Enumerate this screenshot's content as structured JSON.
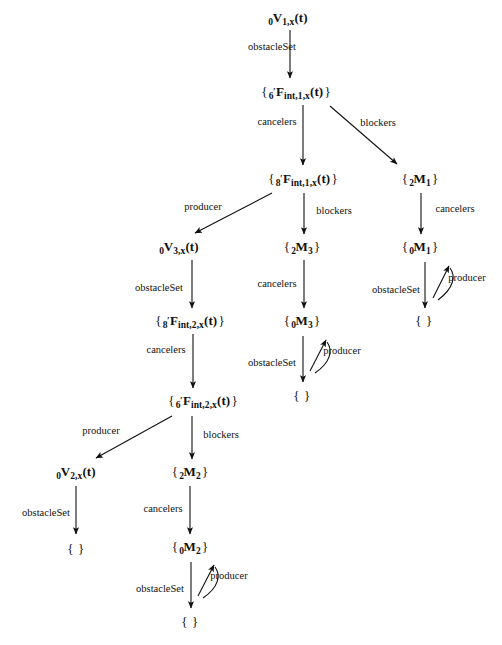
{
  "diagram": {
    "title": "",
    "type": "directed-graph",
    "stroke_color": "#111111",
    "background_color": "#ffffff",
    "nodes": [
      {
        "id": "v1x",
        "label": "0V1,x(t)",
        "parts": {
          "pre": "0",
          "main": "V",
          "sub": "1,x",
          "tail": "(t)",
          "braced": false,
          "prime": false
        },
        "x": 288,
        "y": 19
      },
      {
        "id": "f6int1",
        "label": "{ 6'Fint,1,x(t) }",
        "parts": {
          "pre": "6",
          "main": "F",
          "sub": "int,1,x",
          "tail": "(t)",
          "braced": true,
          "prime": true
        },
        "x": 296,
        "y": 93
      },
      {
        "id": "f8int1",
        "label": "{ 8'Fint,1,x(t) }",
        "parts": {
          "pre": "8",
          "main": "F",
          "sub": "int,1,x",
          "tail": "(t)",
          "braced": true,
          "prime": true
        },
        "x": 303,
        "y": 180
      },
      {
        "id": "m2_1",
        "label": "{ 2M1 }",
        "parts": {
          "pre": "2",
          "main": "M",
          "sub": "1",
          "tail": "",
          "braced": true,
          "prime": false
        },
        "x": 420,
        "y": 180
      },
      {
        "id": "v3x",
        "label": "0V3,x(t)",
        "parts": {
          "pre": "0",
          "main": "V",
          "sub": "3,x",
          "tail": "(t)",
          "braced": false,
          "prime": false
        },
        "x": 179,
        "y": 248
      },
      {
        "id": "m2_3",
        "label": "{ 2M3 }",
        "parts": {
          "pre": "2",
          "main": "M",
          "sub": "3",
          "tail": "",
          "braced": true,
          "prime": false
        },
        "x": 302,
        "y": 248
      },
      {
        "id": "m0_1",
        "label": "{ 0M1 }",
        "parts": {
          "pre": "0",
          "main": "M",
          "sub": "1",
          "tail": "",
          "braced": true,
          "prime": false
        },
        "x": 420,
        "y": 248
      },
      {
        "id": "f8int2",
        "label": "{ 8'Fint,2,x(t) }",
        "parts": {
          "pre": "8",
          "main": "F",
          "sub": "int,2,x",
          "tail": "(t)",
          "braced": true,
          "prime": true
        },
        "x": 190,
        "y": 322
      },
      {
        "id": "m0_3",
        "label": "{ 0M3 }",
        "parts": {
          "pre": "0",
          "main": "M",
          "sub": "3",
          "tail": "",
          "braced": true,
          "prime": false
        },
        "x": 302,
        "y": 322
      },
      {
        "id": "empty_m1",
        "label": "{ }",
        "parts": {
          "empty": true
        },
        "x": 424,
        "y": 320
      },
      {
        "id": "f6int2",
        "label": "{ 6'Fint,2,x(t) }",
        "parts": {
          "pre": "6",
          "main": "F",
          "sub": "int,2,x",
          "tail": "(t)",
          "braced": true,
          "prime": true
        },
        "x": 203,
        "y": 402
      },
      {
        "id": "empty_m3",
        "label": "{ }",
        "parts": {
          "empty": true
        },
        "x": 302,
        "y": 395
      },
      {
        "id": "v2x",
        "label": "0V2,x(t)",
        "parts": {
          "pre": "0",
          "main": "V",
          "sub": "2,x",
          "tail": "(t)",
          "braced": false,
          "prime": false
        },
        "x": 76,
        "y": 473
      },
      {
        "id": "m2_2",
        "label": "{ 2M2 }",
        "parts": {
          "pre": "2",
          "main": "M",
          "sub": "2",
          "tail": "",
          "braced": true,
          "prime": false
        },
        "x": 190,
        "y": 473
      },
      {
        "id": "empty_v2",
        "label": "{ }",
        "parts": {
          "empty": true
        },
        "x": 76,
        "y": 548
      },
      {
        "id": "m0_2",
        "label": "{ 0M2 }",
        "parts": {
          "pre": "0",
          "main": "M",
          "sub": "2",
          "tail": "",
          "braced": true,
          "prime": false
        },
        "x": 190,
        "y": 548
      },
      {
        "id": "empty_m2",
        "label": "{ }",
        "parts": {
          "empty": true
        },
        "x": 190,
        "y": 621
      }
    ],
    "edges": [
      {
        "id": "e1",
        "from": "v1x",
        "to": "f6int1",
        "label": "obstacleSet",
        "label_x": 272,
        "label_y": 47,
        "label_side": "left",
        "kind": "straight-down",
        "x1": 290,
        "y1": 30,
        "x2": 290,
        "y2": 78
      },
      {
        "id": "e2",
        "from": "f6int1",
        "to": "f8int1",
        "label": "cancelers",
        "label_x": 277,
        "label_y": 122,
        "label_side": "left",
        "kind": "straight-down",
        "x1": 303,
        "y1": 105,
        "x2": 303,
        "y2": 165
      },
      {
        "id": "e3",
        "from": "f6int1",
        "to": "m2_1",
        "label": "blockers",
        "label_x": 378,
        "label_y": 123,
        "label_side": "right",
        "kind": "diagonal-down-right",
        "x1": 330,
        "y1": 106,
        "x2": 397,
        "y2": 164
      },
      {
        "id": "e4",
        "from": "f8int1",
        "to": "v3x",
        "label": "producer",
        "label_x": 203,
        "label_y": 207,
        "label_side": "above",
        "kind": "diagonal-down-left",
        "x1": 272,
        "y1": 193,
        "x2": 195,
        "y2": 233
      },
      {
        "id": "e5",
        "from": "f8int1",
        "to": "m2_3",
        "label": "blockers",
        "label_x": 334,
        "label_y": 211,
        "label_side": "right",
        "kind": "straight-down",
        "x1": 304,
        "y1": 193,
        "x2": 304,
        "y2": 234
      },
      {
        "id": "e6",
        "from": "m2_1",
        "to": "m0_1",
        "label": "cancelers",
        "label_x": 455,
        "label_y": 209,
        "label_side": "right",
        "kind": "straight-down",
        "x1": 421,
        "y1": 193,
        "x2": 421,
        "y2": 234
      },
      {
        "id": "e7",
        "from": "v3x",
        "to": "f8int2",
        "label": "obstacleSet",
        "label_x": 159,
        "label_y": 288,
        "label_side": "left",
        "kind": "straight-down",
        "x1": 192,
        "y1": 260,
        "x2": 192,
        "y2": 308
      },
      {
        "id": "e8",
        "from": "m2_3",
        "to": "m0_3",
        "label": "cancelers",
        "label_x": 277,
        "label_y": 284,
        "label_side": "left",
        "kind": "straight-down",
        "x1": 304,
        "y1": 260,
        "x2": 304,
        "y2": 308
      },
      {
        "id": "e9",
        "from": "m0_1",
        "to": "empty_m1",
        "label": "obstacleSet",
        "label_x": 396,
        "label_y": 290,
        "label_side": "left",
        "kind": "straight-down",
        "x1": 425,
        "y1": 262,
        "x2": 425,
        "y2": 308
      },
      {
        "id": "e10",
        "from": "m0_1",
        "to": "m0_1",
        "label": "producer",
        "label_x": 467,
        "label_y": 278,
        "label_side": "right",
        "kind": "hook-up-right",
        "x1": 433,
        "y1": 298,
        "x2": 449,
        "y2": 266
      },
      {
        "id": "e11",
        "from": "f8int2",
        "to": "f6int2",
        "label": "cancelers",
        "label_x": 166,
        "label_y": 350,
        "label_side": "left",
        "kind": "straight-down",
        "x1": 193,
        "y1": 334,
        "x2": 193,
        "y2": 388
      },
      {
        "id": "e12",
        "from": "m0_3",
        "to": "empty_m3",
        "label": "obstacleSet",
        "label_x": 272,
        "label_y": 363,
        "label_side": "left",
        "kind": "straight-down",
        "x1": 303,
        "y1": 336,
        "x2": 303,
        "y2": 382
      },
      {
        "id": "e13",
        "from": "m0_3",
        "to": "m0_3",
        "label": "producer",
        "label_x": 342,
        "label_y": 351,
        "label_side": "right",
        "kind": "hook-up-right",
        "x1": 310,
        "y1": 371,
        "x2": 326,
        "y2": 340
      },
      {
        "id": "e14",
        "from": "f6int2",
        "to": "v2x",
        "label": "producer",
        "label_x": 101,
        "label_y": 431,
        "label_side": "above",
        "kind": "diagonal-down-left",
        "x1": 172,
        "y1": 416,
        "x2": 96,
        "y2": 458
      },
      {
        "id": "e15",
        "from": "f6int2",
        "to": "m2_2",
        "label": "blockers",
        "label_x": 221,
        "label_y": 435,
        "label_side": "right",
        "kind": "straight-down",
        "x1": 192,
        "y1": 416,
        "x2": 192,
        "y2": 459
      },
      {
        "id": "e16",
        "from": "v2x",
        "to": "empty_v2",
        "label": "obstacleSet",
        "label_x": 46,
        "label_y": 513,
        "label_side": "left",
        "kind": "straight-down",
        "x1": 76,
        "y1": 486,
        "x2": 76,
        "y2": 534
      },
      {
        "id": "e17",
        "from": "m2_2",
        "to": "m0_2",
        "label": "cancelers",
        "label_x": 163,
        "label_y": 509,
        "label_side": "left",
        "kind": "straight-down",
        "x1": 190,
        "y1": 486,
        "x2": 190,
        "y2": 534
      },
      {
        "id": "e18",
        "from": "m0_2",
        "to": "empty_m2",
        "label": "obstacleSet",
        "label_x": 160,
        "label_y": 589,
        "label_side": "left",
        "kind": "straight-down",
        "x1": 191,
        "y1": 562,
        "x2": 191,
        "y2": 608
      },
      {
        "id": "e19",
        "from": "m0_2",
        "to": "m0_2",
        "label": "producer",
        "label_x": 229,
        "label_y": 576,
        "label_side": "right",
        "kind": "hook-up-right",
        "x1": 198,
        "y1": 596,
        "x2": 214,
        "y2": 565
      }
    ],
    "edge_label_names": [
      "obstacleSet",
      "cancelers",
      "blockers",
      "producer"
    ]
  }
}
